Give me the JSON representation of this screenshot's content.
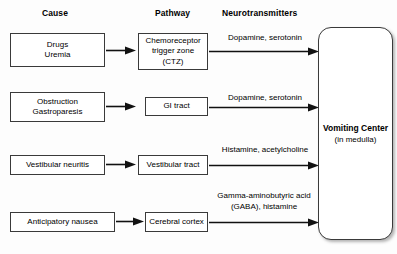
{
  "headers": {
    "cause": "Cause",
    "pathway": "Pathway",
    "neurotransmitters": "Neurotransmitters"
  },
  "vomiting_center": {
    "title": "Vomiting Center",
    "subtitle": "(in medulla)"
  },
  "rows": [
    {
      "cause_line1": "Drugs",
      "cause_line2": "Uremia",
      "pathway_line1": "Chemoreceptor",
      "pathway_line2": "trigger zone",
      "pathway_line3": "(CTZ)",
      "neuro_line1": "Dopamine, serotonin",
      "neuro_line2": ""
    },
    {
      "cause_line1": "Obstruction",
      "cause_line2": "Gastroparesis",
      "pathway_line1": "GI tract",
      "pathway_line2": "",
      "pathway_line3": "",
      "neuro_line1": "Dopamine, serotonin",
      "neuro_line2": ""
    },
    {
      "cause_line1": "Vestibular neuritis",
      "cause_line2": "",
      "pathway_line1": "Vestibular tract",
      "pathway_line2": "",
      "pathway_line3": "",
      "neuro_line1": "Histamine, acetylcholine",
      "neuro_line2": ""
    },
    {
      "cause_line1": "Anticipatory nausea",
      "cause_line2": "",
      "pathway_line1": "Cerebral cortex",
      "pathway_line2": "",
      "pathway_line3": "",
      "neuro_line1": "Gamma-aminobutyric acid",
      "neuro_line2": "(GABA), histamine"
    }
  ],
  "colors": {
    "stroke": "#3a3a3a",
    "text": "#000000",
    "background": "#fdfdfd"
  }
}
